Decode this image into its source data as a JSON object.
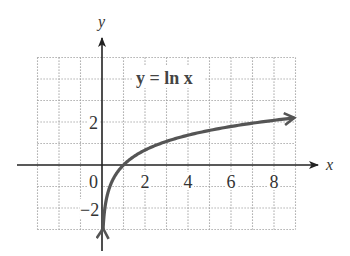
{
  "chart_data": {
    "type": "line",
    "title": "y = ln x",
    "xlabel": "x",
    "ylabel": "y",
    "xlim": [
      -3,
      9
    ],
    "ylim": [
      -3,
      5
    ],
    "grid": true,
    "grid_style": "dotted",
    "x_tick_labels": [
      "0",
      "2",
      "4",
      "6",
      "8"
    ],
    "x_tick_values": [
      0,
      2,
      4,
      6,
      8
    ],
    "y_tick_labels": [
      "2",
      "-2"
    ],
    "y_tick_values": [
      2,
      -2
    ],
    "series": [
      {
        "name": "y = ln x",
        "function": "ln(x)",
        "x": [
          0.05,
          0.1,
          0.25,
          0.5,
          1,
          2,
          3,
          4,
          5,
          6,
          7,
          8,
          8.9
        ],
        "y": [
          -3.0,
          -2.3,
          -1.39,
          -0.69,
          0,
          0.69,
          1.1,
          1.39,
          1.61,
          1.79,
          1.95,
          2.08,
          2.19
        ],
        "color": "#555555",
        "arrows": "both ends"
      }
    ],
    "annotations": [
      {
        "text": "y = ln x",
        "x": 4.5,
        "y": 4
      }
    ]
  },
  "labels": {
    "x_axis": "x",
    "y_axis": "y",
    "equation": "y = ln x",
    "origin": "0",
    "x_ticks": [
      "2",
      "4",
      "6",
      "8"
    ],
    "y_tick_pos": "2",
    "y_tick_neg": "−2"
  },
  "colors": {
    "curve": "#555555",
    "axis": "#222222",
    "grid": "#9a9a9a",
    "text": "#333333"
  }
}
